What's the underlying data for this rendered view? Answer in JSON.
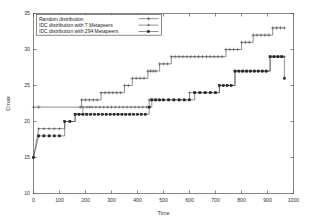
{
  "chart_data": {
    "type": "line",
    "title": "",
    "xlabel": "Time",
    "ylabel": "Cmax",
    "xlim": [
      0,
      1000
    ],
    "ylim": [
      10,
      35
    ],
    "xticks": [
      0,
      100,
      200,
      300,
      400,
      500,
      600,
      700,
      800,
      900,
      1000
    ],
    "yticks": [
      10,
      15,
      20,
      25,
      30,
      35
    ],
    "grid": false,
    "legend_position": "top-left",
    "line_style": "step-post",
    "series": [
      {
        "name": "Random distribution",
        "marker": "plus",
        "color": "#444444",
        "x": [
          0,
          20,
          180,
          185,
          200,
          215,
          230,
          245,
          260,
          275,
          290,
          305,
          320,
          335,
          350,
          365,
          380,
          395,
          410,
          425,
          440,
          450,
          460,
          470,
          485,
          500,
          515,
          530,
          545,
          560,
          575,
          590,
          605,
          620,
          635,
          650,
          665,
          680,
          695,
          710,
          725,
          740,
          755,
          770,
          785,
          800,
          815,
          830,
          845,
          860,
          875,
          890,
          905,
          920,
          935,
          950,
          965
        ],
        "y": [
          22,
          22,
          22,
          23,
          23,
          23,
          23,
          23,
          24,
          24,
          24,
          24,
          24,
          24,
          25,
          25,
          26,
          26,
          26,
          26,
          27,
          27,
          27,
          27,
          28,
          28,
          28,
          29,
          29,
          29,
          29,
          29,
          29,
          29,
          29,
          29,
          29,
          29,
          29,
          29,
          29,
          30,
          30,
          30,
          30,
          31,
          31,
          31,
          32,
          32,
          32,
          32,
          32,
          33,
          33,
          33,
          33
        ]
      },
      {
        "name": "IDC distribution with 7 Metapeers",
        "marker": "plus-small",
        "color": "#444444",
        "x": [
          0,
          20,
          40,
          60,
          80,
          100,
          120,
          140,
          160,
          175,
          190,
          205,
          215,
          225,
          240,
          255,
          270,
          285,
          300,
          315,
          330,
          345,
          360,
          375,
          390,
          405,
          420,
          435,
          445,
          455,
          470,
          485,
          500,
          520,
          540,
          560,
          580,
          600,
          620,
          640,
          660,
          680,
          700,
          715,
          730,
          745,
          760,
          775,
          790,
          805,
          820,
          835,
          850,
          865,
          880,
          895,
          910,
          925,
          940,
          955,
          965
        ],
        "y": [
          15,
          19,
          19,
          19,
          19,
          19,
          20,
          20,
          21,
          21,
          22,
          22,
          22,
          22,
          22,
          22,
          22,
          22,
          22,
          22,
          22,
          22,
          22,
          22,
          22,
          22,
          22,
          22,
          23,
          23,
          23,
          23,
          23,
          23,
          23,
          23,
          23,
          24,
          24,
          24,
          24,
          24,
          24,
          25,
          25,
          25,
          25,
          27,
          27,
          27,
          27,
          27,
          27,
          27,
          27,
          27,
          29,
          29,
          29,
          29,
          29
        ]
      },
      {
        "name": "IDC distribution with 294 Metapeers",
        "marker": "square",
        "color": "#222222",
        "x": [
          0,
          20,
          40,
          60,
          80,
          100,
          120,
          140,
          160,
          175,
          190,
          205,
          220,
          235,
          250,
          265,
          280,
          295,
          310,
          325,
          340,
          355,
          370,
          385,
          400,
          415,
          430,
          445,
          455,
          470,
          485,
          500,
          520,
          540,
          560,
          580,
          600,
          620,
          640,
          660,
          680,
          700,
          715,
          730,
          745,
          760,
          775,
          790,
          805,
          820,
          835,
          850,
          865,
          880,
          895,
          910,
          925,
          940,
          955,
          965
        ],
        "y": [
          15,
          18,
          18,
          18,
          18,
          18,
          20,
          20,
          21,
          21,
          21,
          21,
          21,
          21,
          21,
          21,
          21,
          21,
          21,
          21,
          21,
          21,
          21,
          21,
          21,
          21,
          21,
          22,
          23,
          23,
          23,
          23,
          23,
          23,
          23,
          23,
          23,
          24,
          24,
          24,
          24,
          24,
          25,
          25,
          25,
          25,
          27,
          27,
          27,
          27,
          27,
          27,
          27,
          27,
          27,
          29,
          29,
          29,
          29,
          26
        ]
      }
    ]
  },
  "legend": {
    "entries": [
      {
        "label": "Random distribution"
      },
      {
        "label": "IDC distribution with 7 Metapeers"
      },
      {
        "label": "IDC distribution with 294 Metapeers"
      }
    ]
  }
}
